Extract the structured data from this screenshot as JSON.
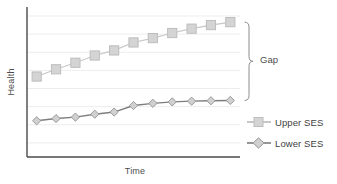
{
  "chart_data": {
    "type": "line",
    "title": "",
    "xlabel": "Time",
    "ylabel": "Health",
    "x": [
      1,
      2,
      3,
      4,
      5,
      6,
      7,
      8,
      9,
      10,
      11
    ],
    "xlim": [
      0.5,
      11.5
    ],
    "ylim": [
      0,
      10
    ],
    "grid": true,
    "gridlines": 8,
    "legend_position": "right",
    "annotations": [
      {
        "name": "gap-brace",
        "label": "Gap",
        "type": "curly-brace",
        "spans_series": [
          "Upper SES",
          "Lower SES"
        ],
        "y_top": 9.3,
        "y_bottom": 3.9
      }
    ],
    "series": [
      {
        "name": "Upper SES",
        "marker": "square",
        "color": "#c9c9c9",
        "line_color": "#c4c4c4",
        "values": [
          5.55,
          6.05,
          6.5,
          7.0,
          7.35,
          7.9,
          8.2,
          8.55,
          8.85,
          9.1,
          9.3
        ]
      },
      {
        "name": "Lower SES",
        "marker": "diamond",
        "color": "#cfcfcf",
        "line_color": "#808080",
        "values": [
          2.5,
          2.65,
          2.75,
          2.95,
          3.1,
          3.55,
          3.7,
          3.8,
          3.85,
          3.88,
          3.9
        ]
      }
    ]
  },
  "legend": {
    "items": [
      {
        "label": "Upper SES",
        "marker": "square"
      },
      {
        "label": "Lower SES",
        "marker": "diamond"
      }
    ]
  },
  "colors": {
    "upper_marker_fill": "#d4d4d4",
    "upper_marker_edge": "#bdbdbd",
    "upper_line": "#c7c7c7",
    "lower_marker_fill": "#d0d0d0",
    "lower_marker_edge": "#9a9a9a",
    "lower_line": "#7d7d7d",
    "grid": "#ededed",
    "axis": "#4a4a4a",
    "text": "#4d4d4d",
    "brace": "#8c8c8c"
  }
}
